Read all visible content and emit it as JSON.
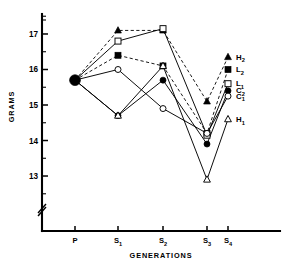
{
  "chart_data": {
    "type": "line",
    "title": "",
    "xlabel": "GENERATIONS",
    "ylabel": "GRAMS",
    "categories": [
      "P",
      "S1",
      "S2",
      "S3",
      "S4"
    ],
    "category_labels": [
      {
        "base": "P",
        "sub": ""
      },
      {
        "base": "S",
        "sub": "1"
      },
      {
        "base": "S",
        "sub": "2"
      },
      {
        "base": "S",
        "sub": "3"
      },
      {
        "base": "S",
        "sub": "4"
      }
    ],
    "ylim": [
      12.55,
      17.45
    ],
    "yticks": [
      13,
      14,
      15,
      16,
      17
    ],
    "ytick_labels": [
      "13",
      "14",
      "15",
      "16",
      "17"
    ],
    "yminor_step": 0.5,
    "grid": false,
    "axis_break": true,
    "legend_position": "right-end-of-line",
    "series": [
      {
        "name": "H2",
        "label_base": "H",
        "label_sub": "2",
        "marker": "triangle",
        "fill": "filled",
        "line": "dashed",
        "values": [
          15.7,
          17.1,
          17.1,
          15.1,
          16.35
        ]
      },
      {
        "name": "L2",
        "label_base": "L",
        "label_sub": "2",
        "marker": "square",
        "fill": "filled",
        "line": "dashed",
        "values": [
          15.7,
          16.4,
          16.1,
          14.2,
          16.0
        ]
      },
      {
        "name": "L1",
        "label_base": "L",
        "label_sub": "1",
        "marker": "square",
        "fill": "open",
        "line": "solid",
        "values": [
          15.7,
          16.8,
          17.15,
          14.15,
          15.6
        ]
      },
      {
        "name": "C2",
        "label_base": "C",
        "label_sub": "2",
        "marker": "circle",
        "fill": "filled",
        "line": "solid",
        "values": [
          15.7,
          14.7,
          15.7,
          13.9,
          15.4
        ]
      },
      {
        "name": "C1",
        "label_base": "C",
        "label_sub": "1",
        "marker": "circle",
        "fill": "open",
        "line": "solid",
        "values": [
          15.7,
          16.0,
          14.9,
          14.2,
          15.25
        ]
      },
      {
        "name": "H1",
        "label_base": "H",
        "label_sub": "1",
        "marker": "triangle",
        "fill": "open",
        "line": "solid",
        "values": [
          15.7,
          14.7,
          16.1,
          12.9,
          14.6
        ]
      }
    ],
    "origin_marker": {
      "type": "circle",
      "fill": "filled",
      "size": "large",
      "value": 15.7
    }
  }
}
